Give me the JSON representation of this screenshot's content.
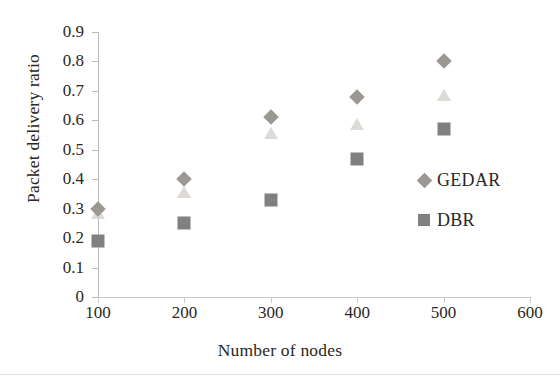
{
  "chart_data": {
    "type": "scatter",
    "title": "",
    "xlabel": "Number of nodes",
    "ylabel": "Packet delivery ratio",
    "x": [
      100,
      200,
      300,
      400,
      500
    ],
    "xlim": [
      100,
      600
    ],
    "ylim": [
      0,
      0.9
    ],
    "xticks": [
      "100",
      "200",
      "300",
      "400",
      "500",
      "600"
    ],
    "xtick_values": [
      100,
      200,
      300,
      400,
      500,
      600
    ],
    "yticks": [
      "0",
      "0.1",
      "0.2",
      "0.3",
      "0.4",
      "0.5",
      "0.6",
      "0.7",
      "0.8",
      "0.9"
    ],
    "ytick_values": [
      0,
      0.1,
      0.2,
      0.3,
      0.4,
      0.5,
      0.6,
      0.7,
      0.8,
      0.9
    ],
    "grid": false,
    "legend_position": "right",
    "series": [
      {
        "name": "GEDAR",
        "marker": "diamond",
        "color": "#9b9894",
        "in_legend": true,
        "values": [
          0.3,
          0.4,
          0.61,
          0.68,
          0.8
        ]
      },
      {
        "name": "",
        "marker": "triangle",
        "color": "#dedbd7",
        "in_legend": false,
        "values": [
          0.29,
          0.36,
          0.56,
          0.59,
          0.69
        ]
      },
      {
        "name": "DBR",
        "marker": "square",
        "color": "#808080",
        "in_legend": true,
        "values": [
          0.19,
          0.25,
          0.33,
          0.47,
          0.57
        ]
      }
    ]
  },
  "legend": {
    "entries": [
      {
        "label": "GEDAR",
        "marker": "diamond"
      },
      {
        "label": "DBR",
        "marker": "square"
      }
    ]
  },
  "colors": {
    "gedar": "#9b9894",
    "triangle_series": "#dedbd7",
    "dbr": "#808080",
    "axis": "#bdbab6",
    "text": "#2a2724"
  }
}
